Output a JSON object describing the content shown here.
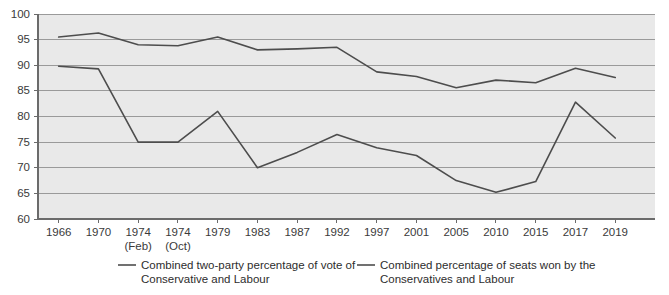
{
  "chart_data": {
    "type": "line",
    "title": "",
    "xlabel": "",
    "ylabel": "",
    "ylim": [
      60,
      100
    ],
    "ytick_values": [
      60,
      65,
      70,
      75,
      80,
      85,
      90,
      95,
      100
    ],
    "ytick_labels": [
      "60",
      "65",
      "70",
      "75",
      "80",
      "85",
      "90",
      "95",
      "100"
    ],
    "grid": true,
    "legend_position": "bottom",
    "categories": [
      "1966",
      "1970",
      "1974",
      "1974",
      "1979",
      "1983",
      "1987",
      "1992",
      "1997",
      "2001",
      "2005",
      "2010",
      "2015",
      "2017",
      "2019"
    ],
    "category_sublabels": [
      "",
      "",
      "(Feb)",
      "(Oct)",
      "",
      "",
      "",
      "",
      "",
      "",
      "",
      "",
      "",
      "",
      ""
    ],
    "series": [
      {
        "name": "Combined two-party percentage of vote of Conservative and Labour",
        "color": "#4d4d4d",
        "values": [
          89.8,
          89.3,
          75.0,
          75.0,
          81.0,
          70.0,
          73.0,
          76.5,
          73.9,
          72.4,
          67.5,
          65.2,
          67.3,
          82.8,
          75.8
        ]
      },
      {
        "name": "Combined percentage of seats won by the Conservatives and Labour",
        "color": "#4d4d4d",
        "values": [
          95.5,
          96.3,
          94.0,
          93.8,
          95.5,
          93.0,
          93.2,
          93.5,
          88.7,
          87.8,
          85.6,
          87.1,
          86.6,
          89.4,
          87.6
        ]
      }
    ]
  },
  "legend": {
    "entries": [
      {
        "line1": "Combined two-party percentage of vote of",
        "line2": "Conservative and Labour"
      },
      {
        "line1": "Combined percentage of seats won by the",
        "line2": "Conservatives and Labour"
      }
    ]
  },
  "colors": {
    "plot_background": "#e9e9e9",
    "gridline": "#9a9a9a",
    "axis": "#6b6b6b",
    "series_line": "#4d4d4d",
    "text": "#3a3a3a"
  }
}
